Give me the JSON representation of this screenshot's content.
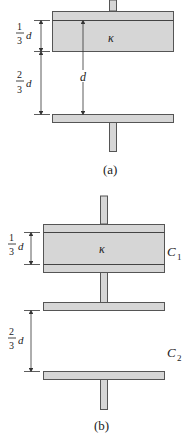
{
  "figure_a": {
    "caption": "(a)",
    "dielectric_symbol": "κ",
    "dim_upper": {
      "num": "1",
      "den": "3",
      "var": "d"
    },
    "dim_lower": {
      "num": "2",
      "den": "3",
      "var": "d"
    },
    "dim_total": "d"
  },
  "figure_b": {
    "caption": "(b)",
    "dielectric_symbol": "κ",
    "dim_upper": {
      "num": "1",
      "den": "3",
      "var": "d"
    },
    "dim_lower": {
      "num": "2",
      "den": "3",
      "var": "d"
    },
    "label_c1": {
      "main": "C",
      "sub": "1"
    },
    "label_c2": {
      "main": "C",
      "sub": "2"
    }
  },
  "colors": {
    "plate_fill": "#d6d6d6",
    "plate_stroke": "#555555"
  }
}
